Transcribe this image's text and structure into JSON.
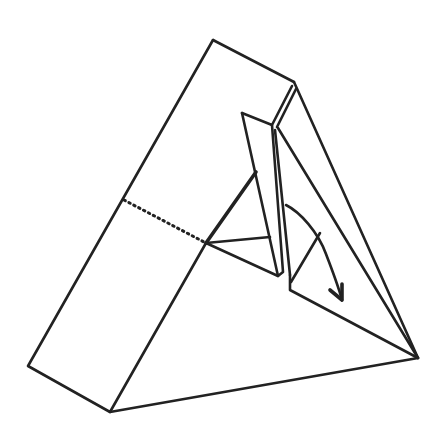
{
  "diagram": {
    "type": "origami-fold-step",
    "description": "Triangular prism-shaped paper model with an inner flap being folded down",
    "line_color": "#222222",
    "background": "#ffffff",
    "elements": {
      "outer_body": "triangular-prism-outline",
      "hidden_edge": "dotted-line",
      "inner_flap": "raised-triangular-flap",
      "fold_arrow": "curved-arrow-down-right"
    }
  }
}
